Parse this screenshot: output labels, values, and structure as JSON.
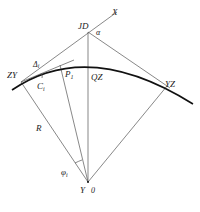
{
  "figure": {
    "type": "circular curve deflection-angle layout diagram",
    "labels": {
      "x_axis": "X",
      "intersection_point": "JD",
      "deflection_angle": "α",
      "curve_start": "ZY",
      "delta_angle": "Δ",
      "delta_subscript": "i",
      "chord": "C",
      "chord_subscript": "i",
      "point": "P",
      "point_subscript": "1",
      "curve_mid": "QZ",
      "curve_end": "YZ",
      "radius": "R",
      "central_angle": "φ",
      "central_angle_subscript": "i",
      "center_y": "Y",
      "center_o": "0"
    },
    "colors": {
      "line": "#555555",
      "curve": "#111111",
      "text": "#222222",
      "background": "#ffffff"
    }
  }
}
